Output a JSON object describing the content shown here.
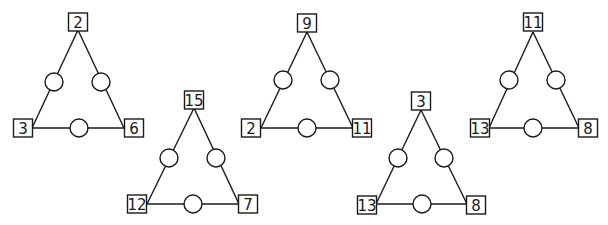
{
  "puzzle": {
    "description": "Triangle sum puzzles: corner numbers in squares, blank circles on each side",
    "line_color": "#1a1a1a",
    "background": "#ffffff",
    "triangles": [
      {
        "id": "triangle-1",
        "corners": {
          "top": "2",
          "left": "3",
          "right": "6"
        },
        "geometry": {
          "top": {
            "x": 78,
            "y": 22
          },
          "left": {
            "x": 23,
            "y": 128
          },
          "right": {
            "x": 134,
            "y": 128
          },
          "apex_y": 30,
          "base_y": 128,
          "base_x1": 32,
          "base_x2": 124,
          "circle_left": {
            "x": 54,
            "y": 82
          },
          "circle_right": {
            "x": 101,
            "y": 82
          },
          "circle_bottom": {
            "x": 79,
            "y": 128
          }
        }
      },
      {
        "id": "triangle-2",
        "corners": {
          "top": "15",
          "left": "12",
          "right": "7"
        },
        "geometry": {
          "top": {
            "x": 194,
            "y": 100
          },
          "left": {
            "x": 137,
            "y": 204
          },
          "right": {
            "x": 248,
            "y": 204
          },
          "apex_y": 108,
          "base_y": 204,
          "base_x1": 147,
          "base_x2": 239,
          "circle_left": {
            "x": 169,
            "y": 158
          },
          "circle_right": {
            "x": 216,
            "y": 158
          },
          "circle_bottom": {
            "x": 193,
            "y": 204
          }
        }
      },
      {
        "id": "triangle-3",
        "corners": {
          "top": "9",
          "left": "2",
          "right": "11"
        },
        "geometry": {
          "top": {
            "x": 307,
            "y": 23
          },
          "left": {
            "x": 251,
            "y": 128
          },
          "right": {
            "x": 362,
            "y": 128
          },
          "apex_y": 32,
          "base_y": 128,
          "base_x1": 261,
          "base_x2": 353,
          "circle_left": {
            "x": 283,
            "y": 80
          },
          "circle_right": {
            "x": 330,
            "y": 80
          },
          "circle_bottom": {
            "x": 307,
            "y": 128
          }
        }
      },
      {
        "id": "triangle-4",
        "corners": {
          "top": "3",
          "left": "13",
          "right": "8"
        },
        "geometry": {
          "top": {
            "x": 421,
            "y": 101
          },
          "left": {
            "x": 367,
            "y": 205
          },
          "right": {
            "x": 476,
            "y": 205
          },
          "apex_y": 110,
          "base_y": 204,
          "base_x1": 376,
          "base_x2": 467,
          "circle_left": {
            "x": 398,
            "y": 158
          },
          "circle_right": {
            "x": 444,
            "y": 158
          },
          "circle_bottom": {
            "x": 422,
            "y": 204
          }
        }
      },
      {
        "id": "triangle-5",
        "corners": {
          "top": "11",
          "left": "13",
          "right": "8"
        },
        "geometry": {
          "top": {
            "x": 533,
            "y": 22
          },
          "left": {
            "x": 480,
            "y": 128
          },
          "right": {
            "x": 588,
            "y": 128
          },
          "apex_y": 32,
          "base_y": 128,
          "base_x1": 489,
          "base_x2": 579,
          "circle_left": {
            "x": 509,
            "y": 80
          },
          "circle_right": {
            "x": 556,
            "y": 80
          },
          "circle_bottom": {
            "x": 533,
            "y": 128
          }
        }
      }
    ],
    "layout": {
      "box_width": 19,
      "box_height": 18,
      "circle_radius": 9
    }
  }
}
